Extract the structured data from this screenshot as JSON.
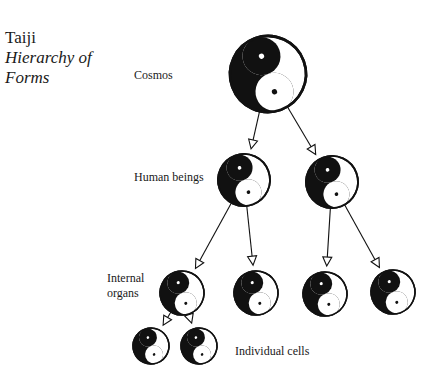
{
  "title": {
    "line1": "Taiji",
    "line2": "Hierarchy of",
    "line3": "Forms"
  },
  "levels": [
    {
      "label": "Cosmos"
    },
    {
      "label": "Human beings"
    },
    {
      "label_line1": "Internal",
      "label_line2": "organs"
    },
    {
      "label": "Individual cells"
    }
  ],
  "colors": {
    "ink": "#111111",
    "paper": "#ffffff"
  },
  "nodes": [
    {
      "id": "cosmos",
      "cx": 268,
      "cy": 74,
      "r": 38
    },
    {
      "id": "human-left",
      "cx": 244,
      "cy": 180,
      "r": 26
    },
    {
      "id": "human-right",
      "cx": 332,
      "cy": 182,
      "r": 26
    },
    {
      "id": "organ-1",
      "cx": 182,
      "cy": 293,
      "r": 22
    },
    {
      "id": "organ-2",
      "cx": 256,
      "cy": 293,
      "r": 22
    },
    {
      "id": "organ-3",
      "cx": 325,
      "cy": 294,
      "r": 22
    },
    {
      "id": "organ-4",
      "cx": 393,
      "cy": 292,
      "r": 22
    },
    {
      "id": "cell-1",
      "cx": 151,
      "cy": 346,
      "r": 18
    },
    {
      "id": "cell-2",
      "cx": 199,
      "cy": 346,
      "r": 18
    }
  ],
  "edges": [
    {
      "from": "cosmos",
      "to": "human-left"
    },
    {
      "from": "cosmos",
      "to": "human-right"
    },
    {
      "from": "human-left",
      "to": "organ-1"
    },
    {
      "from": "human-left",
      "to": "organ-2"
    },
    {
      "from": "human-right",
      "to": "organ-3"
    },
    {
      "from": "human-right",
      "to": "organ-4"
    },
    {
      "from": "organ-1",
      "to": "cell-1"
    },
    {
      "from": "organ-1",
      "to": "cell-2"
    }
  ]
}
